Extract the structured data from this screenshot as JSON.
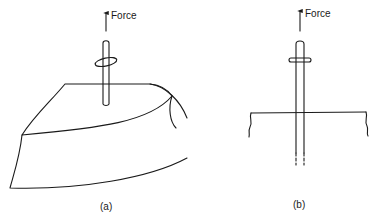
{
  "figure": {
    "panels": [
      {
        "id": "a",
        "force_label": "Force",
        "caption": "(a)",
        "description": "Rod with collar embedded in a curved block of material; upward force applied"
      },
      {
        "id": "b",
        "force_label": "Force",
        "caption": "(b)",
        "description": "Cross-section view of rod with collar passing through a surface; upward force applied"
      }
    ]
  }
}
